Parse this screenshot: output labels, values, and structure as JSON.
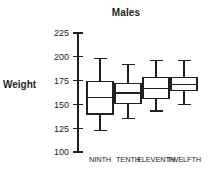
{
  "chart_data": {
    "type": "box",
    "title": "Males",
    "xlabel": "",
    "ylabel": "Weight",
    "ylim": [
      100,
      225
    ],
    "yticks": [
      100,
      125,
      150,
      175,
      200,
      225
    ],
    "ytick_labels": [
      "100",
      "125",
      "150",
      "175",
      "200",
      "225"
    ],
    "grid": false,
    "legend": false,
    "categories": [
      "NINTH",
      "TENTH",
      "ELEVENTH",
      "TWELFTH"
    ],
    "boxes": [
      {
        "category": "NINTH",
        "min": 123,
        "q1": 140,
        "median": 157,
        "q3": 174,
        "max": 198
      },
      {
        "category": "TENTH",
        "min": 135,
        "q1": 151,
        "median": 162,
        "q3": 172,
        "max": 192
      },
      {
        "category": "ELEVENTH",
        "min": 143,
        "q1": 156,
        "median": 167,
        "q3": 178,
        "max": 196
      },
      {
        "category": "TWELFTH",
        "min": 150,
        "q1": 165,
        "median": 171,
        "q3": 178,
        "max": 196
      }
    ],
    "colors": {
      "line": "#231f20",
      "box_fill": "#ffffff",
      "background": "#ffffff"
    }
  }
}
